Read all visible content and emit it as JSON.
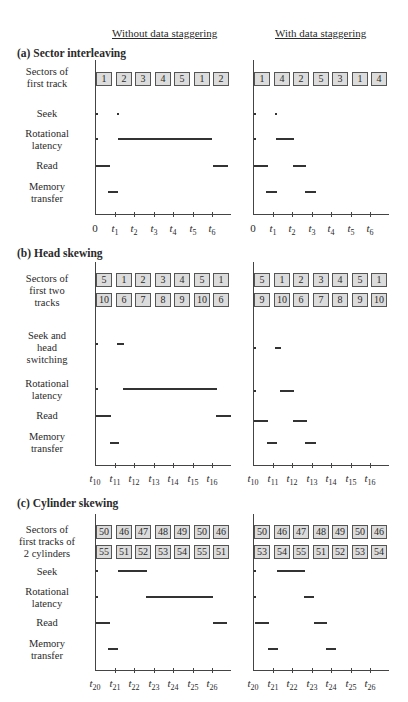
{
  "column_headers": {
    "left": "Without data staggering",
    "right": "With data staggering"
  },
  "sections": [
    {
      "title": "(a) Sector interleaving",
      "title_y": 47,
      "axis_top": 60,
      "axis_y": 214,
      "tick_label_y": 222,
      "tick_labels": [
        "0",
        "t1",
        "t2",
        "t3",
        "t4",
        "t5",
        "t6"
      ],
      "tick_base": "t",
      "tick_subs": [
        "",
        "1",
        "2",
        "3",
        "4",
        "5",
        "6"
      ],
      "tick_zero_plain": true,
      "row_labels": [
        {
          "text": [
            "Sectors of",
            "first track"
          ],
          "y": 66
        },
        {
          "text": [
            "Seek"
          ],
          "y": 108
        },
        {
          "text": [
            "Rotational",
            "latency"
          ],
          "y": 128
        },
        {
          "text": [
            "Read"
          ],
          "y": 160
        },
        {
          "text": [
            "Memory",
            "transfer"
          ],
          "y": 181
        }
      ],
      "box_rows": [
        {
          "y": 72,
          "left": [
            "1",
            "2",
            "3",
            "4",
            "5",
            "1",
            "2"
          ],
          "right": [
            "1",
            "4",
            "2",
            "5",
            "3",
            "1",
            "4"
          ]
        }
      ],
      "bars": {
        "left": [
          {
            "row": "seek",
            "type": "dot",
            "x": 96,
            "y": 114
          },
          {
            "row": "seek",
            "type": "dot",
            "x": 117,
            "y": 114
          },
          {
            "row": "rotational_latency",
            "type": "dot",
            "x": 96,
            "y": 139
          },
          {
            "row": "rotational_latency",
            "x1": 118,
            "x2": 212,
            "y": 139
          },
          {
            "row": "read",
            "x1": 96,
            "x2": 110,
            "y": 166
          },
          {
            "row": "read",
            "x1": 213,
            "x2": 228,
            "y": 166
          },
          {
            "row": "memory_transfer",
            "x1": 108,
            "x2": 118,
            "y": 192
          }
        ],
        "right": [
          {
            "row": "seek",
            "type": "dot",
            "x": 254,
            "y": 114
          },
          {
            "row": "seek",
            "type": "dot",
            "x": 275,
            "y": 114
          },
          {
            "row": "rotational_latency",
            "type": "dot",
            "x": 254,
            "y": 139
          },
          {
            "row": "rotational_latency",
            "x1": 276,
            "x2": 294,
            "y": 139
          },
          {
            "row": "read",
            "x1": 254,
            "x2": 268,
            "y": 166
          },
          {
            "row": "read",
            "x1": 293,
            "x2": 306,
            "y": 166
          },
          {
            "row": "memory_transfer",
            "x1": 266,
            "x2": 277,
            "y": 192
          },
          {
            "row": "memory_transfer",
            "x1": 305,
            "x2": 316,
            "y": 192
          }
        ]
      }
    },
    {
      "title": "(b) Head skewing",
      "title_y": 247,
      "axis_top": 262,
      "axis_y": 465,
      "tick_label_y": 472,
      "tick_labels": [
        "t10",
        "t11",
        "t12",
        "t13",
        "t14",
        "t15",
        "t16"
      ],
      "tick_base": "t",
      "tick_subs": [
        "10",
        "11",
        "12",
        "13",
        "14",
        "15",
        "16"
      ],
      "tick_zero_plain": false,
      "row_labels": [
        {
          "text": [
            "Sectors of",
            "first two",
            "tracks"
          ],
          "y": 273
        },
        {
          "text": [
            "Seek and",
            "head",
            "switching"
          ],
          "y": 330
        },
        {
          "text": [
            "Rotational",
            "latency"
          ],
          "y": 378
        },
        {
          "text": [
            "Read"
          ],
          "y": 410
        },
        {
          "text": [
            "Memory",
            "transfer"
          ],
          "y": 431
        }
      ],
      "box_rows": [
        {
          "y": 273,
          "left": [
            "5",
            "1",
            "2",
            "3",
            "4",
            "5",
            "1"
          ],
          "right": [
            "5",
            "1",
            "2",
            "3",
            "4",
            "5",
            "1"
          ]
        },
        {
          "y": 293,
          "left": [
            "10",
            "6",
            "7",
            "8",
            "9",
            "10",
            "6"
          ],
          "right": [
            "9",
            "10",
            "6",
            "7",
            "8",
            "9",
            "10"
          ]
        }
      ],
      "bars": {
        "left": [
          {
            "row": "seek_head_switching",
            "type": "dot",
            "x": 96,
            "y": 344
          },
          {
            "row": "seek_head_switching",
            "x1": 117,
            "x2": 124,
            "y": 344
          },
          {
            "row": "rotational_latency",
            "type": "dot",
            "x": 96,
            "y": 389
          },
          {
            "row": "rotational_latency",
            "x1": 123,
            "x2": 217,
            "y": 389
          },
          {
            "row": "read",
            "x1": 96,
            "x2": 111,
            "y": 416
          },
          {
            "row": "read",
            "x1": 216,
            "x2": 231,
            "y": 416
          },
          {
            "row": "memory_transfer",
            "x1": 110,
            "x2": 119,
            "y": 443
          }
        ],
        "right": [
          {
            "row": "seek_head_switching",
            "type": "dot",
            "x": 254,
            "y": 348
          },
          {
            "row": "seek_head_switching",
            "x1": 275,
            "x2": 281,
            "y": 348
          },
          {
            "row": "rotational_latency",
            "type": "dot",
            "x": 254,
            "y": 391
          },
          {
            "row": "rotational_latency",
            "x1": 280,
            "x2": 294,
            "y": 391
          },
          {
            "row": "read",
            "x1": 254,
            "x2": 268,
            "y": 421
          },
          {
            "row": "read",
            "x1": 293,
            "x2": 307,
            "y": 421
          },
          {
            "row": "memory_transfer",
            "x1": 267,
            "x2": 277,
            "y": 443
          },
          {
            "row": "memory_transfer",
            "x1": 305,
            "x2": 316,
            "y": 443
          }
        ]
      }
    },
    {
      "title": "(c) Cylinder skewing",
      "title_y": 497,
      "axis_top": 514,
      "axis_y": 670,
      "tick_label_y": 677,
      "tick_labels": [
        "t20",
        "t21",
        "t22",
        "t23",
        "t24",
        "t25",
        "t26"
      ],
      "tick_base": "t",
      "tick_subs": [
        "20",
        "21",
        "22",
        "23",
        "24",
        "25",
        "26"
      ],
      "tick_zero_plain": false,
      "row_labels": [
        {
          "text": [
            "Sectors of",
            "first tracks of",
            "2 cylinders"
          ],
          "y": 524
        },
        {
          "text": [
            "Seek"
          ],
          "y": 566
        },
        {
          "text": [
            "Rotational",
            "latency"
          ],
          "y": 586
        },
        {
          "text": [
            "Read"
          ],
          "y": 617
        },
        {
          "text": [
            "Memory",
            "transfer"
          ],
          "y": 638
        }
      ],
      "box_rows": [
        {
          "y": 525,
          "left": [
            "50",
            "46",
            "47",
            "48",
            "49",
            "50",
            "46"
          ],
          "right": [
            "50",
            "46",
            "47",
            "48",
            "49",
            "50",
            "46"
          ]
        },
        {
          "y": 545,
          "left": [
            "55",
            "51",
            "52",
            "53",
            "54",
            "55",
            "51"
          ],
          "right": [
            "53",
            "54",
            "55",
            "51",
            "52",
            "53",
            "54"
          ]
        }
      ],
      "bars": {
        "left": [
          {
            "row": "seek",
            "type": "dot",
            "x": 96,
            "y": 571
          },
          {
            "row": "seek",
            "x1": 118,
            "x2": 147,
            "y": 571
          },
          {
            "row": "rotational_latency",
            "type": "dot",
            "x": 96,
            "y": 597
          },
          {
            "row": "rotational_latency",
            "x1": 146,
            "x2": 213,
            "y": 597
          },
          {
            "row": "read",
            "x1": 96,
            "x2": 110,
            "y": 623
          },
          {
            "row": "read",
            "x1": 213,
            "x2": 227,
            "y": 623
          },
          {
            "row": "memory_transfer",
            "x1": 108,
            "x2": 118,
            "y": 649
          }
        ],
        "right": [
          {
            "row": "seek",
            "type": "dot",
            "x": 254,
            "y": 571
          },
          {
            "row": "seek",
            "x1": 277,
            "x2": 305,
            "y": 571
          },
          {
            "row": "rotational_latency",
            "type": "dot",
            "x": 254,
            "y": 597
          },
          {
            "row": "rotational_latency",
            "x1": 304,
            "x2": 314,
            "y": 597
          },
          {
            "row": "read",
            "x1": 255,
            "x2": 269,
            "y": 623
          },
          {
            "row": "read",
            "x1": 314,
            "x2": 327,
            "y": 623
          },
          {
            "row": "memory_transfer",
            "x1": 268,
            "x2": 278,
            "y": 649
          },
          {
            "row": "memory_transfer",
            "x1": 326,
            "x2": 336,
            "y": 649
          }
        ]
      }
    }
  ],
  "layout": {
    "left_axis_x": 95,
    "right_axis_x": 253,
    "axis_len": 136,
    "tick_pitch": 19.5,
    "box_pitch": 19.5,
    "box_width": 14
  }
}
